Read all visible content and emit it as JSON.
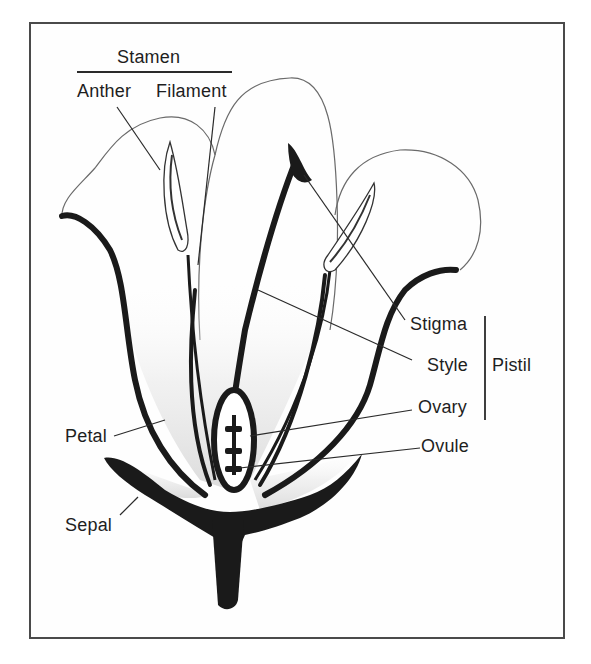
{
  "diagram": {
    "colors": {
      "frame": "#4a4a4a",
      "ink": "#1a1a1a",
      "petal_shade": "#e4e4e4",
      "label_text": "#1e1e1e"
    },
    "groups": {
      "stamen": {
        "label": "Stamen",
        "parts": [
          "Anther",
          "Filament"
        ]
      },
      "pistil": {
        "label": "Pistil",
        "parts": [
          "Stigma",
          "Style",
          "Ovary"
        ]
      }
    },
    "labels": {
      "stamen": "Stamen",
      "anther": "Anther",
      "filament": "Filament",
      "stigma": "Stigma",
      "style": "Style",
      "pistil": "Pistil",
      "ovary": "Ovary",
      "ovule": "Ovule",
      "petal": "Petal",
      "sepal": "Sepal"
    }
  }
}
